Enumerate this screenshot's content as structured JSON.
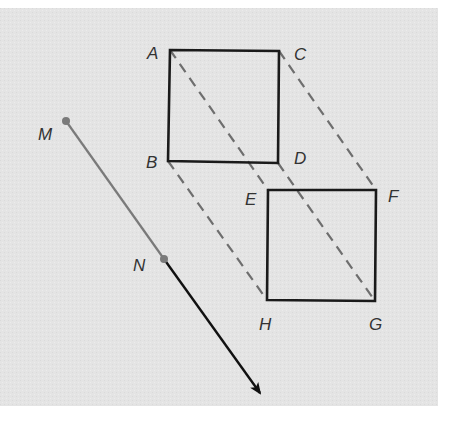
{
  "diagram": {
    "type": "geometric-translation",
    "background": {
      "x": 0,
      "y": 8,
      "width": 438,
      "height": 398,
      "color": "#e4e4e4"
    },
    "colors": {
      "square_stroke": "#1a1a1a",
      "dashed_stroke": "#6e6e6e",
      "vector_gray": "#7a7a7a",
      "vector_black": "#111111",
      "label": "#333333"
    },
    "points": {
      "A": {
        "x": 170,
        "y": 50,
        "label": "A",
        "lx": 147,
        "ly": 59
      },
      "C": {
        "x": 279,
        "y": 51,
        "label": "C",
        "lx": 294,
        "ly": 60
      },
      "B": {
        "x": 168,
        "y": 161,
        "label": "B",
        "lx": 146,
        "ly": 168
      },
      "D": {
        "x": 278,
        "y": 163,
        "label": "D",
        "lx": 294,
        "ly": 164
      },
      "E": {
        "x": 268,
        "y": 190,
        "label": "E",
        "lx": 245,
        "ly": 205
      },
      "F": {
        "x": 376,
        "y": 190,
        "label": "F",
        "lx": 388,
        "ly": 202
      },
      "H": {
        "x": 267,
        "y": 300,
        "label": "H",
        "lx": 259,
        "ly": 330
      },
      "G": {
        "x": 375,
        "y": 301,
        "label": "G",
        "lx": 369,
        "ly": 330
      },
      "M": {
        "x": 66,
        "y": 121,
        "label": "M",
        "lx": 38,
        "ly": 140
      },
      "N": {
        "x": 164,
        "y": 259,
        "label": "N",
        "lx": 133,
        "ly": 271
      }
    },
    "squares": [
      {
        "name": "ABDC",
        "corners": [
          "A",
          "C",
          "D",
          "B"
        ]
      },
      {
        "name": "EFGH",
        "corners": [
          "E",
          "F",
          "G",
          "H"
        ]
      }
    ],
    "dashed_segments": [
      {
        "from": "A",
        "to": "E"
      },
      {
        "from": "C",
        "to": "F"
      },
      {
        "from": "B",
        "to": "H"
      },
      {
        "from": "D",
        "to": "G"
      }
    ],
    "vector": {
      "start": "M",
      "mid": "N",
      "tip": {
        "x": 260,
        "y": 393
      }
    }
  }
}
